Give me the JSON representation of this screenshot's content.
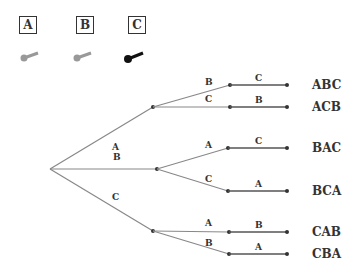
{
  "legend": {
    "items": [
      {
        "label": "A",
        "icon": "key-icon",
        "color": "#999999"
      },
      {
        "label": "B",
        "icon": "key-icon",
        "color": "#999999"
      },
      {
        "label": "C",
        "icon": "key-icon",
        "color": "#111111"
      }
    ]
  },
  "tree": {
    "level1": [
      "A",
      "B",
      "C"
    ],
    "level2": [
      {
        "parent": "A",
        "label": "B"
      },
      {
        "parent": "A",
        "label": "C"
      },
      {
        "parent": "B",
        "label": "A"
      },
      {
        "parent": "B",
        "label": "C"
      },
      {
        "parent": "C",
        "label": "A"
      },
      {
        "parent": "C",
        "label": "B"
      }
    ],
    "level3": [
      "C",
      "B",
      "C",
      "A",
      "B",
      "A"
    ],
    "outcomes": [
      "ABC",
      "ACB",
      "BAC",
      "BCA",
      "CAB",
      "CBA"
    ]
  },
  "colors": {
    "line": "#888888",
    "dark_line": "#555555",
    "node": "#333333"
  }
}
